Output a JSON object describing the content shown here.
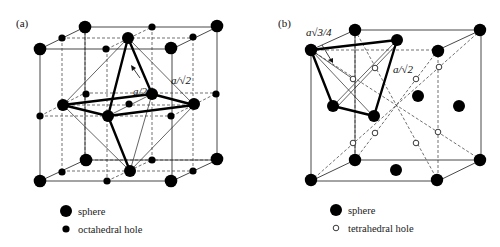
{
  "panels": [
    {
      "id": "a",
      "label": "(a)",
      "annotations": {
        "half_edge": "a/2",
        "face_diagonal": "a/√2"
      },
      "legend": [
        {
          "symbol": "large-filled-circle",
          "text": "sphere"
        },
        {
          "symbol": "small-filled-circle",
          "text": "octahedral hole"
        }
      ]
    },
    {
      "id": "b",
      "label": "(b)",
      "annotations": {
        "body_diagonal_quarter": "a√3/4",
        "face_diagonal": "a/√2"
      },
      "legend": [
        {
          "symbol": "large-filled-circle",
          "text": "sphere"
        },
        {
          "symbol": "open-circle",
          "text": "tetrahedral hole"
        }
      ]
    }
  ],
  "colors": {
    "ink": "#000000",
    "background": "#ffffff"
  }
}
